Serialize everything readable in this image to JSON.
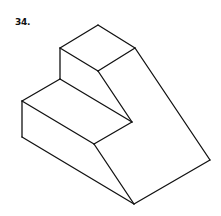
{
  "figure": {
    "number_label": "34.",
    "stroke_color": "#111111",
    "background": "#ffffff",
    "vertices": {
      "A": [
        98,
        25
      ],
      "B": [
        60,
        48
      ],
      "C": [
        135,
        48
      ],
      "D": [
        98,
        71
      ],
      "E": [
        60,
        79
      ],
      "F": [
        22,
        101
      ],
      "G": [
        22,
        137
      ],
      "H": [
        132,
        122
      ],
      "I": [
        94,
        144
      ],
      "J": [
        134,
        204
      ],
      "K": [
        210,
        160
      ]
    },
    "edges": [
      [
        "A",
        "B"
      ],
      [
        "A",
        "C"
      ],
      [
        "B",
        "D"
      ],
      [
        "C",
        "D"
      ],
      [
        "B",
        "E"
      ],
      [
        "D",
        "H"
      ],
      [
        "E",
        "H"
      ],
      [
        "E",
        "F"
      ],
      [
        "F",
        "I"
      ],
      [
        "I",
        "H"
      ],
      [
        "F",
        "G"
      ],
      [
        "G",
        "J"
      ],
      [
        "I",
        "J"
      ],
      [
        "J",
        "K"
      ],
      [
        "C",
        "K"
      ]
    ]
  }
}
